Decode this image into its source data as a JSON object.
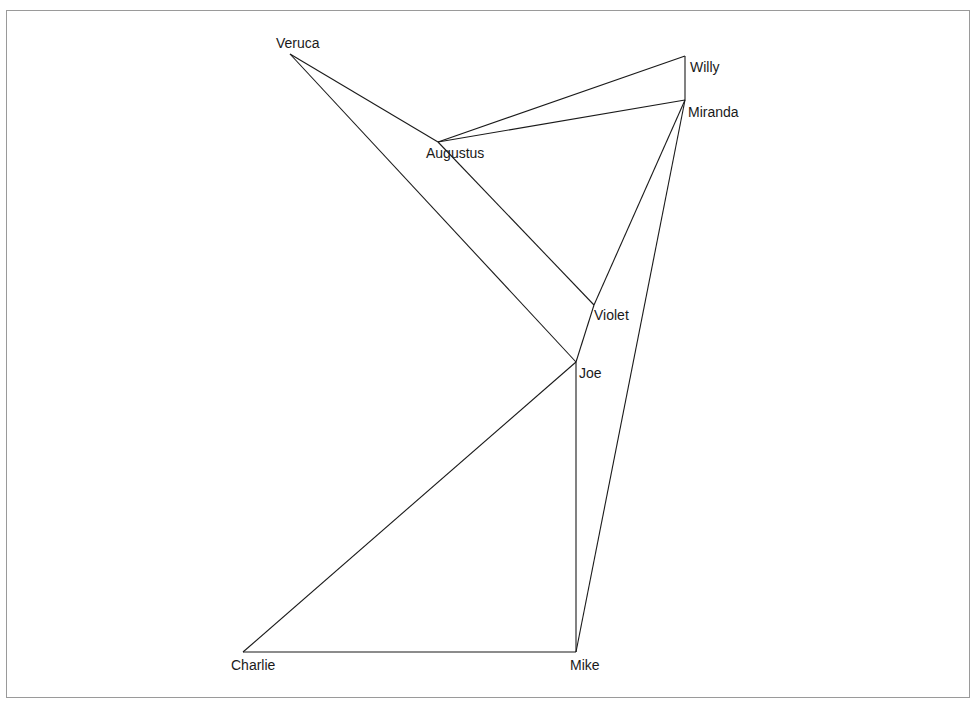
{
  "diagram": {
    "type": "network-graph",
    "nodes": [
      {
        "id": "Veruca",
        "label": "Veruca",
        "x": 290,
        "y": 54,
        "lx": 276,
        "ly": 48
      },
      {
        "id": "Willy",
        "label": "Willy",
        "x": 685,
        "y": 56,
        "lx": 690,
        "ly": 72
      },
      {
        "id": "Miranda",
        "label": "Miranda",
        "x": 685,
        "y": 100,
        "lx": 688,
        "ly": 117
      },
      {
        "id": "Augustus",
        "label": "Augustus",
        "x": 438,
        "y": 142,
        "lx": 426,
        "ly": 158
      },
      {
        "id": "Violet",
        "label": "Violet",
        "x": 594,
        "y": 305,
        "lx": 594,
        "ly": 320
      },
      {
        "id": "Joe",
        "label": "Joe",
        "x": 576,
        "y": 362,
        "lx": 579,
        "ly": 378
      },
      {
        "id": "Charlie",
        "label": "Charlie",
        "x": 243,
        "y": 652,
        "lx": 231,
        "ly": 670
      },
      {
        "id": "Mike",
        "label": "Mike",
        "x": 576,
        "y": 652,
        "lx": 570,
        "ly": 670
      }
    ],
    "edges": [
      [
        "Veruca",
        "Augustus"
      ],
      [
        "Veruca",
        "Joe"
      ],
      [
        "Augustus",
        "Willy"
      ],
      [
        "Augustus",
        "Miranda"
      ],
      [
        "Augustus",
        "Violet"
      ],
      [
        "Willy",
        "Miranda"
      ],
      [
        "Miranda",
        "Violet"
      ],
      [
        "Miranda",
        "Mike"
      ],
      [
        "Violet",
        "Joe"
      ],
      [
        "Joe",
        "Charlie"
      ],
      [
        "Joe",
        "Mike"
      ],
      [
        "Charlie",
        "Mike"
      ]
    ],
    "colors": {
      "edge": "#1a1a1a",
      "label": "#1a1a1a",
      "frame": "#9a9a9a"
    }
  }
}
